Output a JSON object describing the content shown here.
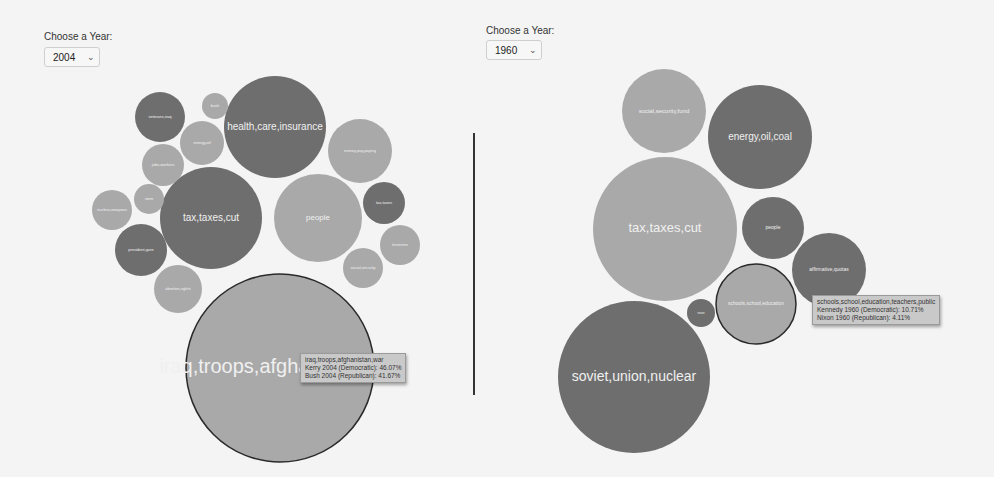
{
  "left": {
    "label": "Choose a Year:",
    "selected_year": "2004",
    "tooltip": {
      "topic": "iraq,troops,afghanistan,war",
      "line1": "Kerry 2004 (Democratic): 46.07%",
      "line2": "Bush 2004 (Republican): 41.67%"
    }
  },
  "right": {
    "label": "Choose a Year:",
    "selected_year": "1960",
    "tooltip": {
      "topic": "schools,school,education,teachers,public",
      "line1": "Kennedy 1960 (Democratic): 10.71%",
      "line2": "Nixon 1960 (Republican): 4.11%"
    }
  },
  "colors": {
    "democratic": "#6e6e6e",
    "republican": "#a9a9a9",
    "highlight_stroke": "#2a2a2a",
    "label": "#f0f0f0",
    "background": "#f4f4f4"
  },
  "chart_data": [
    {
      "type": "bubble",
      "title": "Debate topics 2004",
      "year": "2004",
      "bubbles": [
        {
          "label": "iraq,troops,afghanistan,war",
          "cx": 280,
          "cy": 368,
          "r": 94,
          "party": "republican",
          "font": 20,
          "highlighted": true
        },
        {
          "label": "tax,taxes,cut",
          "cx": 211,
          "cy": 218,
          "r": 51,
          "party": "democratic",
          "font": 10
        },
        {
          "label": "health,care,insurance",
          "cx": 275,
          "cy": 127,
          "r": 51,
          "party": "democratic",
          "font": 10
        },
        {
          "label": "people",
          "cx": 318,
          "cy": 218,
          "r": 44,
          "party": "republican",
          "font": 8
        },
        {
          "label": "money,pay,paying",
          "cx": 360,
          "cy": 151,
          "r": 32,
          "party": "republican",
          "font": 4
        },
        {
          "label": "veterans,iraq",
          "cx": 160,
          "cy": 117,
          "r": 25,
          "party": "democratic",
          "font": 4
        },
        {
          "label": "energy,oil",
          "cx": 202,
          "cy": 143,
          "r": 22,
          "party": "republican",
          "font": 4
        },
        {
          "label": "jobs,workers",
          "cx": 163,
          "cy": 165,
          "r": 21,
          "party": "republican",
          "font": 4
        },
        {
          "label": "bush",
          "cx": 215,
          "cy": 106,
          "r": 13,
          "party": "republican",
          "font": 4
        },
        {
          "label": "nuclear,weapons",
          "cx": 112,
          "cy": 210,
          "r": 20,
          "party": "republican",
          "font": 4
        },
        {
          "label": "stem",
          "cx": 149,
          "cy": 199,
          "r": 15,
          "party": "republican",
          "font": 4
        },
        {
          "label": "president,gore",
          "cx": 141,
          "cy": 250,
          "r": 26,
          "party": "democratic",
          "font": 4
        },
        {
          "label": "abortion,rights",
          "cx": 178,
          "cy": 289,
          "r": 24,
          "party": "republican",
          "font": 4
        },
        {
          "label": "tax,taxes",
          "cx": 384,
          "cy": 203,
          "r": 21,
          "party": "democratic",
          "font": 4
        },
        {
          "label": "terrorism",
          "cx": 400,
          "cy": 245,
          "r": 20,
          "party": "republican",
          "font": 4
        },
        {
          "label": "social,security",
          "cx": 363,
          "cy": 268,
          "r": 20,
          "party": "republican",
          "font": 4
        }
      ]
    },
    {
      "type": "bubble",
      "title": "Debate topics 1960",
      "year": "1960",
      "bubbles": [
        {
          "label": "tax,taxes,cut",
          "cx": 665,
          "cy": 229,
          "r": 72,
          "party": "republican",
          "font": 13
        },
        {
          "label": "soviet,union,nuclear",
          "cx": 634,
          "cy": 377,
          "r": 76,
          "party": "democratic",
          "font": 14
        },
        {
          "label": "energy,oil,coal",
          "cx": 760,
          "cy": 137,
          "r": 52,
          "party": "democratic",
          "font": 10
        },
        {
          "label": "social,security,fund",
          "cx": 664,
          "cy": 111,
          "r": 42,
          "party": "republican",
          "font": 6
        },
        {
          "label": "people",
          "cx": 773,
          "cy": 228,
          "r": 31,
          "party": "democratic",
          "font": 5
        },
        {
          "label": "affirmative,quotas",
          "cx": 829,
          "cy": 270,
          "r": 37,
          "party": "democratic",
          "font": 5
        },
        {
          "label": "schools,school,education",
          "cx": 756,
          "cy": 304,
          "r": 40,
          "party": "republican",
          "font": 5,
          "highlighted": true
        },
        {
          "label": "nixon",
          "cx": 701,
          "cy": 313,
          "r": 14,
          "party": "democratic",
          "font": 3
        }
      ]
    }
  ]
}
